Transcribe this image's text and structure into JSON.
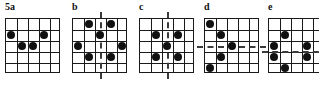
{
  "figure": {
    "background_color": "#ffffff",
    "line_color": "#1a1a1a",
    "dot_color": "#111111",
    "axis_color": "#3a3a3a",
    "grid_rows": 5,
    "grid_cols": 5,
    "panels": [
      {
        "id": "5a",
        "label": "5a",
        "left": 0,
        "dots": [
          {
            "row": 2,
            "col": 1
          },
          {
            "row": 2,
            "col": 4
          },
          {
            "row": 3,
            "col": 2
          },
          {
            "row": 3,
            "col": 3
          }
        ],
        "axes": []
      },
      {
        "id": "b",
        "label": "b",
        "left": 67,
        "dots": [
          {
            "row": 1,
            "col": 2
          },
          {
            "row": 1,
            "col": 4
          },
          {
            "row": 2,
            "col": 3
          },
          {
            "row": 3,
            "col": 1
          },
          {
            "row": 3,
            "col": 5
          },
          {
            "row": 4,
            "col": 2
          },
          {
            "row": 4,
            "col": 4
          }
        ],
        "axes": [
          {
            "orientation": "vertical",
            "position": 3.0,
            "overhang": 6
          }
        ]
      },
      {
        "id": "c",
        "label": "c",
        "left": 134,
        "dots": [
          {
            "row": 2,
            "col": 2
          },
          {
            "row": 2,
            "col": 4
          },
          {
            "row": 3,
            "col": 3
          },
          {
            "row": 4,
            "col": 2
          },
          {
            "row": 4,
            "col": 4
          }
        ],
        "axes": [
          {
            "orientation": "vertical",
            "position": 3.0,
            "overhang": 6
          }
        ]
      },
      {
        "id": "d",
        "label": "d",
        "left": 199,
        "dots": [
          {
            "row": 1,
            "col": 1
          },
          {
            "row": 2,
            "col": 2
          },
          {
            "row": 3,
            "col": 3
          },
          {
            "row": 4,
            "col": 2
          },
          {
            "row": 5,
            "col": 1
          }
        ],
        "axes": [
          {
            "orientation": "horizontal",
            "position": 3.0,
            "overhang": 7
          }
        ]
      },
      {
        "id": "e",
        "label": "e",
        "left": 263,
        "dots": [
          {
            "row": 2,
            "col": 2
          },
          {
            "row": 3,
            "col": 1
          },
          {
            "row": 3,
            "col": 4
          },
          {
            "row": 4,
            "col": 1
          },
          {
            "row": 4,
            "col": 4
          },
          {
            "row": 5,
            "col": 2
          }
        ],
        "axes": [
          {
            "orientation": "horizontal",
            "position": 3.5,
            "overhang": 6
          }
        ]
      }
    ]
  }
}
